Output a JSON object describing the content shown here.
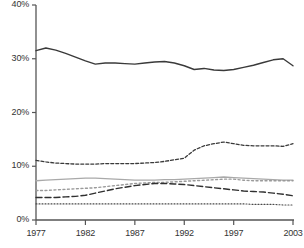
{
  "chart_data": {
    "type": "line",
    "title": "",
    "xlabel": "",
    "ylabel": "",
    "xlim": [
      1977,
      2003
    ],
    "ylim": [
      0,
      40
    ],
    "grid": false,
    "legend": "none",
    "y_ticks": [
      "0%",
      "10%",
      "20%",
      "30%",
      "40%"
    ],
    "y_tick_values": [
      0,
      10,
      20,
      30,
      40
    ],
    "x_ticks": [
      "1977",
      "1982",
      "1987",
      "1992",
      "1997",
      "2003"
    ],
    "x_tick_values": [
      1977,
      1982,
      1987,
      1992,
      1997,
      2003
    ],
    "x": [
      1977,
      1978,
      1979,
      1980,
      1981,
      1982,
      1983,
      1984,
      1985,
      1986,
      1987,
      1988,
      1989,
      1990,
      1991,
      1992,
      1993,
      1994,
      1995,
      1996,
      1997,
      1998,
      1999,
      2000,
      2001,
      2002,
      2003
    ],
    "series": [
      {
        "name": "series-1-solid-dark",
        "style": "solid",
        "color": "#3a3a3a",
        "width": 1.4,
        "values": [
          31.5,
          32.0,
          31.6,
          31.0,
          30.3,
          29.6,
          29.0,
          29.2,
          29.2,
          29.1,
          29.0,
          29.2,
          29.4,
          29.5,
          29.2,
          28.7,
          28.0,
          28.2,
          27.9,
          27.8,
          28.0,
          28.4,
          28.8,
          29.3,
          29.8,
          30.0,
          28.7
        ]
      },
      {
        "name": "series-2-dashed-dark",
        "style": "dashed-short",
        "color": "#3a3a3a",
        "width": 1.3,
        "values": [
          11.1,
          10.8,
          10.6,
          10.5,
          10.4,
          10.4,
          10.4,
          10.5,
          10.5,
          10.5,
          10.5,
          10.6,
          10.7,
          10.9,
          11.2,
          11.5,
          13.0,
          13.8,
          14.2,
          14.5,
          14.2,
          13.9,
          13.8,
          13.8,
          13.8,
          13.7,
          14.2
        ]
      },
      {
        "name": "series-3-solid-gray",
        "style": "solid",
        "color": "#a9a9a9",
        "width": 1.3,
        "values": [
          7.3,
          7.4,
          7.5,
          7.6,
          7.7,
          7.8,
          7.8,
          7.7,
          7.6,
          7.5,
          7.4,
          7.4,
          7.4,
          7.5,
          7.5,
          7.6,
          7.7,
          7.8,
          7.9,
          8.0,
          7.9,
          7.8,
          7.7,
          7.6,
          7.5,
          7.4,
          7.4
        ]
      },
      {
        "name": "series-4-dotted-gray",
        "style": "dotted-medium",
        "color": "#9a9a9a",
        "width": 1.4,
        "values": [
          5.5,
          5.5,
          5.6,
          5.7,
          5.8,
          5.9,
          6.0,
          6.2,
          6.4,
          6.6,
          6.8,
          6.9,
          7.0,
          7.0,
          7.1,
          7.2,
          7.3,
          7.4,
          7.5,
          7.6,
          7.6,
          7.4,
          7.3,
          7.3,
          7.3,
          7.3,
          7.3
        ]
      },
      {
        "name": "series-5-dashed-long",
        "style": "dashed-long",
        "color": "#303030",
        "width": 1.4,
        "values": [
          4.2,
          4.2,
          4.2,
          4.3,
          4.4,
          4.6,
          5.0,
          5.4,
          5.8,
          6.1,
          6.4,
          6.6,
          6.8,
          6.8,
          6.7,
          6.6,
          6.4,
          6.2,
          6.0,
          5.8,
          5.6,
          5.4,
          5.3,
          5.2,
          5.0,
          4.8,
          4.5
        ]
      },
      {
        "name": "series-6-dotted-fine",
        "style": "dotted-fine",
        "color": "#4a4a4a",
        "width": 1.1,
        "values": [
          3.0,
          3.0,
          3.0,
          3.0,
          3.0,
          3.0,
          3.0,
          3.0,
          3.0,
          3.0,
          3.0,
          3.0,
          3.0,
          3.0,
          3.0,
          3.0,
          3.0,
          3.0,
          3.0,
          3.0,
          3.0,
          3.0,
          2.9,
          2.9,
          2.9,
          2.8,
          2.8
        ]
      }
    ]
  },
  "axes": {
    "axis_color": "#555555",
    "tick_color": "#555555"
  }
}
